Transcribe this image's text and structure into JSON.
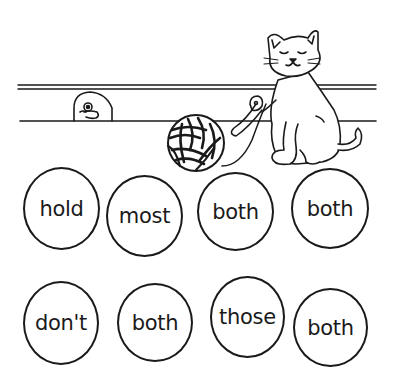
{
  "scene": {
    "description": "Cat with yarn ball beside a shelf; mouse peeking from a mouse hole",
    "colors": {
      "ink": "#1a1a1a",
      "paper": "#ffffff"
    }
  },
  "illustration": {
    "items": [
      {
        "name": "cat",
        "icon": "cat-icon"
      },
      {
        "name": "yarn-ball",
        "icon": "yarn-ball-icon"
      },
      {
        "name": "mouse-in-hole",
        "icon": "mouse-icon"
      },
      {
        "name": "shelf-rail",
        "icon": "rail-icon"
      }
    ]
  },
  "bubbles": [
    {
      "word": "hold",
      "x": 23,
      "y": 167,
      "w": 77,
      "h": 83
    },
    {
      "word": "most",
      "x": 106,
      "y": 175,
      "w": 77,
      "h": 82
    },
    {
      "word": "both",
      "x": 197,
      "y": 172,
      "w": 77,
      "h": 79
    },
    {
      "word": "both",
      "x": 291,
      "y": 168,
      "w": 78,
      "h": 81
    },
    {
      "word": "don't",
      "x": 23,
      "y": 281,
      "w": 76,
      "h": 84
    },
    {
      "word": "both",
      "x": 117,
      "y": 283,
      "w": 76,
      "h": 79
    },
    {
      "word": "those",
      "x": 210,
      "y": 276,
      "w": 75,
      "h": 82
    },
    {
      "word": "both",
      "x": 293,
      "y": 288,
      "w": 75,
      "h": 79
    }
  ]
}
